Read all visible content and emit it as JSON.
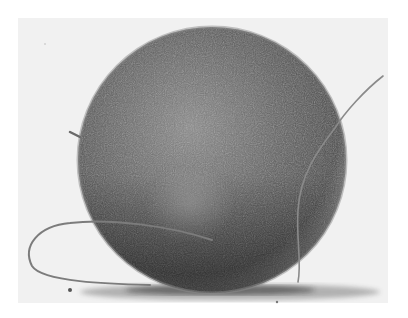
{
  "image": {
    "kind": "scanning electron micrograph",
    "description": "Spherical cell-like body with textured granular surface, resting on a substrate, with two thin filaments",
    "colors": {
      "background": "#f2f2f2",
      "sphere_dark": "#3c3c3c",
      "sphere_mid": "#6e6e6e",
      "sphere_light": "#9a9a9a",
      "filament": "#8a8a8a",
      "shadow": "#2a2a2a"
    }
  },
  "labels": {
    "alt": "Micrograph of a textured sphere with filaments"
  }
}
